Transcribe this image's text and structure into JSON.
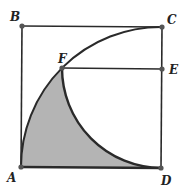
{
  "diagram": {
    "type": "geometry",
    "points": {
      "A": {
        "label": "A",
        "x": 21,
        "y": 167
      },
      "B": {
        "label": "B",
        "x": 22,
        "y": 26
      },
      "C": {
        "label": "C",
        "x": 162,
        "y": 27
      },
      "D": {
        "label": "D",
        "x": 161,
        "y": 168
      },
      "E": {
        "label": "E",
        "x": 162,
        "y": 69
      },
      "F": {
        "label": "F",
        "x": 62,
        "y": 68
      }
    },
    "segments": [
      "AB",
      "BC",
      "CD",
      "DA",
      "FE"
    ],
    "arcs": [
      {
        "from": "A",
        "to": "C",
        "center": "D"
      },
      {
        "from": "F",
        "to": "D",
        "center": "E"
      }
    ],
    "shaded_region": "A-F-D",
    "colors": {
      "line": "#2a2a2a",
      "fill": "#b4b4b4",
      "background": "#ffffff",
      "point": "#555555"
    }
  }
}
